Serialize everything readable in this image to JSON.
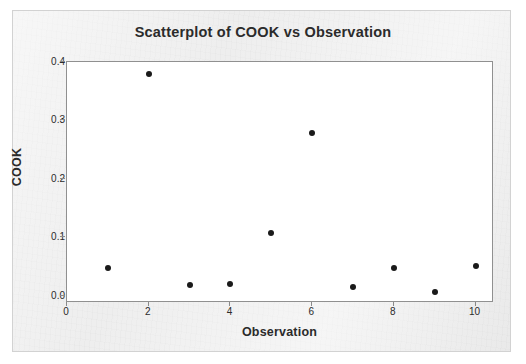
{
  "chart_data": {
    "type": "scatter",
    "title": "Scatterplot of COOK vs Observation",
    "xlabel": "Observation",
    "ylabel": "COOK",
    "x": [
      1,
      2,
      3,
      4,
      5,
      6,
      7,
      8,
      9,
      10
    ],
    "values": [
      0.047,
      0.38,
      0.019,
      0.021,
      0.108,
      0.278,
      0.016,
      0.048,
      0.007,
      0.052
    ],
    "series": [
      {
        "name": "COOK",
        "points": [
          {
            "x": 1,
            "y": 0.047
          },
          {
            "x": 2,
            "y": 0.38
          },
          {
            "x": 3,
            "y": 0.019
          },
          {
            "x": 4,
            "y": 0.021
          },
          {
            "x": 5,
            "y": 0.108
          },
          {
            "x": 6,
            "y": 0.278
          },
          {
            "x": 7,
            "y": 0.016
          },
          {
            "x": 8,
            "y": 0.048
          },
          {
            "x": 9,
            "y": 0.007
          },
          {
            "x": 10,
            "y": 0.052
          }
        ]
      }
    ],
    "xlim": [
      0,
      10.45
    ],
    "ylim": [
      -0.012,
      0.4
    ],
    "xticks": [
      0,
      2,
      4,
      6,
      8,
      10
    ],
    "xtick_labels": [
      "0",
      "2",
      "4",
      "6",
      "8",
      "10"
    ],
    "yticks": [
      0.0,
      0.1,
      0.2,
      0.3,
      0.4
    ],
    "ytick_labels": [
      "0.0",
      "0.1",
      "0.2",
      "0.3",
      "0.4"
    ],
    "grid": false,
    "legend": false,
    "marker_color": "#1a1a1a",
    "plot_background": "#ffffff",
    "figure_background": "#eeeeee"
  }
}
